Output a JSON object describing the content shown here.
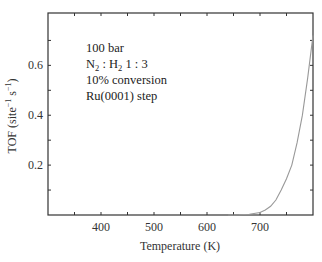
{
  "chart_data": {
    "type": "line",
    "title": "",
    "xlabel": "Temperature (K)",
    "ylabel": "TOF (site⁻¹ s⁻¹)",
    "xlim": [
      300,
      800
    ],
    "ylim": [
      0,
      0.81
    ],
    "xticks": [
      400,
      500,
      600,
      700
    ],
    "xticks_minor": [
      350,
      450,
      550,
      650,
      750
    ],
    "yticks": [
      0.2,
      0.4,
      0.6
    ],
    "yticks_minor": [
      0.1,
      0.3,
      0.5,
      0.7
    ],
    "grid": false,
    "legend": null,
    "annotations": [
      "100 bar",
      "N₂ : H₂ 1 : 3",
      "10% conversion",
      "Ru(0001) step"
    ],
    "series": [
      {
        "name": "TOF",
        "color": "#999999",
        "x": [
          640,
          660,
          680,
          700,
          710,
          720,
          730,
          740,
          750,
          760,
          770,
          780,
          790,
          800
        ],
        "y": [
          0.0,
          0.001,
          0.003,
          0.01,
          0.02,
          0.035,
          0.06,
          0.1,
          0.145,
          0.2,
          0.29,
          0.4,
          0.55,
          0.72
        ]
      }
    ]
  },
  "labels": {
    "xlabel": "Temperature (K)",
    "ylabel_main": "TOF (site",
    "ylabel_sup1": "−1",
    "ylabel_mid": " s",
    "ylabel_sup2": "−1",
    "ylabel_end": ")",
    "annot_line1": "100 bar",
    "annot_line2_a": "N",
    "annot_line2_sub1": "2",
    "annot_line2_b": " : H",
    "annot_line2_sub2": "2",
    "annot_line2_c": " 1 : 3",
    "annot_line3": "10% conversion",
    "annot_line4": "Ru(0001) step"
  },
  "colors": {
    "axis": "#333333",
    "curve": "#999999"
  }
}
